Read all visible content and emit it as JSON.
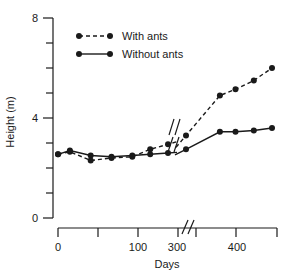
{
  "chart_data": {
    "type": "line",
    "title": "",
    "xlabel": "Days",
    "ylabel": "Height (m)",
    "xlim": [
      0,
      460
    ],
    "ylim": [
      0,
      8
    ],
    "grid": false,
    "legend_position": "top-left",
    "axis_break": {
      "axis": "x",
      "between": [
        200,
        280
      ],
      "note": "broken x-axis between 100-200 tick region and 300"
    },
    "x_ticks_major": [
      0,
      100,
      300,
      400
    ],
    "x_tick_labels": [
      "0",
      "100",
      "300",
      "400"
    ],
    "x_ticks_minor": [
      50,
      150,
      350,
      450
    ],
    "y_ticks_major": [
      0,
      4,
      8
    ],
    "y_tick_labels": [
      "0",
      "4",
      "8"
    ],
    "y_ticks_minor": [
      1,
      2,
      3,
      5,
      6,
      7
    ],
    "series": [
      {
        "name": "With ants",
        "style": "dashed",
        "marker": "filled-circle",
        "x": [
          0,
          20,
          55,
          90,
          125,
          155,
          185,
          290,
          355,
          385,
          420,
          455
        ],
        "y": [
          2.55,
          2.65,
          2.3,
          2.4,
          2.45,
          2.75,
          2.95,
          3.3,
          4.9,
          5.15,
          5.5,
          6.0
        ]
      },
      {
        "name": "Without ants",
        "style": "solid",
        "marker": "filled-circle",
        "x": [
          0,
          20,
          55,
          90,
          125,
          155,
          185,
          290,
          355,
          385,
          420,
          455
        ],
        "y": [
          2.55,
          2.7,
          2.5,
          2.45,
          2.5,
          2.55,
          2.6,
          2.75,
          3.45,
          3.45,
          3.5,
          3.6
        ]
      }
    ]
  },
  "legend": {
    "items": [
      {
        "label": "With ants",
        "style": "dashed"
      },
      {
        "label": "Without ants",
        "style": "solid"
      }
    ]
  },
  "axes": {
    "y_label": "Height (m)",
    "x_label": "Days",
    "y_top_label": "8",
    "y_mid_label": "4",
    "y_zero_label": "0",
    "x_labels": [
      "0",
      "100",
      "300",
      "400"
    ]
  }
}
